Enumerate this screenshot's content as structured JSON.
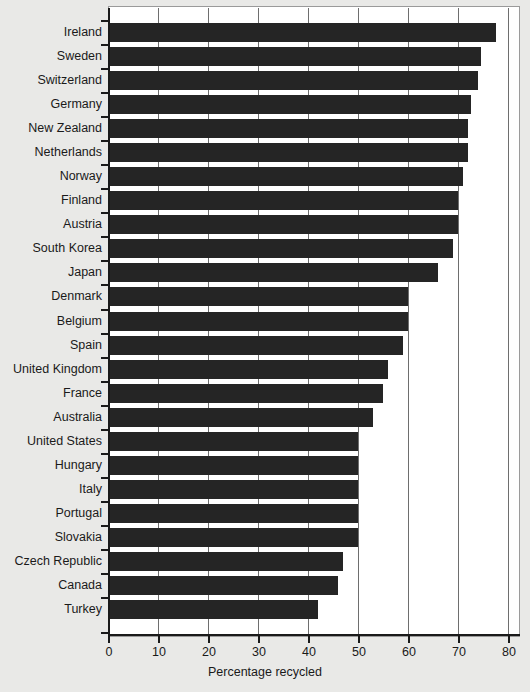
{
  "chart_data": {
    "type": "bar",
    "orientation": "horizontal",
    "title": "",
    "xlabel": "Percentage recycled",
    "ylabel": "",
    "xlim": [
      0,
      83
    ],
    "ylim": null,
    "grid": "vertical gridlines at each x tick",
    "legend": "none",
    "xticks": [
      0,
      10,
      20,
      30,
      40,
      50,
      60,
      70,
      80
    ],
    "xtick_labels": [
      "0",
      "10",
      "20",
      "30",
      "40",
      "50",
      "60",
      "70",
      "80"
    ],
    "bar_color": "#252525",
    "background_color": "#ffffff",
    "page_color": "#e9e9e7",
    "categories": [
      "Ireland",
      "Sweden",
      "Switzerland",
      "Germany",
      "New Zealand",
      "Netherlands",
      "Norway",
      "Finland",
      "Austria",
      "South Korea",
      "Japan",
      "Denmark",
      "Belgium",
      "Spain",
      "United Kingdom",
      "France",
      "Australia",
      "United States",
      "Hungary",
      "Italy",
      "Portugal",
      "Slovakia",
      "Czech Republic",
      "Canada",
      "Turkey"
    ],
    "values": [
      77.5,
      74.5,
      74.0,
      72.5,
      72.0,
      72.0,
      71.0,
      70.0,
      70.0,
      69.0,
      66.0,
      60.0,
      60.0,
      59.0,
      56.0,
      55.0,
      53.0,
      50.0,
      50.0,
      50.0,
      50.0,
      50.0,
      47.0,
      46.0,
      42.0
    ]
  }
}
